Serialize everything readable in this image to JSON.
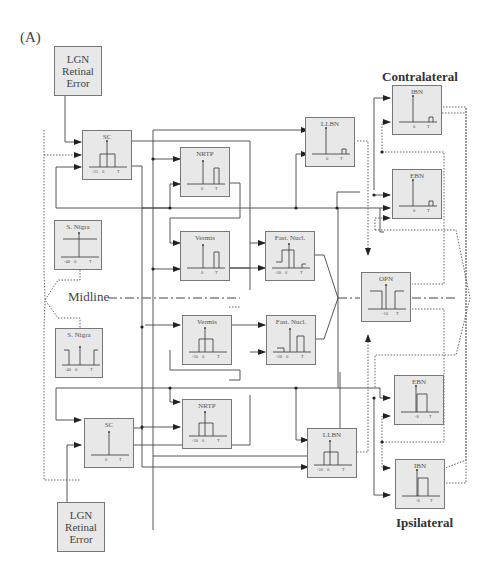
{
  "panel_label": "(A)",
  "side_labels": {
    "contralateral": "Contralateral",
    "ipsilateral": "Ipsilateral"
  },
  "midline_label": "Midline",
  "colors": {
    "box_fill": "#e8e8e8",
    "box_border": "#777777",
    "line": "#333333",
    "dotted": "#555555"
  },
  "boxes": {
    "lgn_top": {
      "title": "LGN\nRetinal\nError"
    },
    "lgn_bot": {
      "title": "LGN\nRetinal\nError"
    },
    "sc_top": {
      "title": "SC",
      "ticks": [
        "-25",
        "0",
        "T"
      ]
    },
    "sc_bot": {
      "title": "SC",
      "ticks": [
        "0",
        "T"
      ]
    },
    "nrtp_top": {
      "title": "NRTP",
      "ticks": [
        "0",
        "T"
      ]
    },
    "nrtp_bot": {
      "title": "NRTP",
      "ticks": [
        "-20",
        "0",
        "T"
      ]
    },
    "vermis_top": {
      "title": "Vermis",
      "ticks": [
        "0",
        "T"
      ]
    },
    "vermis_bot": {
      "title": "Vermis",
      "ticks": [
        "-20",
        "0",
        "T"
      ]
    },
    "snigra_top": {
      "title": "S. Nigra",
      "ticks": [
        "-40",
        "0",
        "T"
      ]
    },
    "snigra_bot": {
      "title": "S. Nigra",
      "ticks": [
        "-40",
        "0",
        "T"
      ]
    },
    "fastn_top": {
      "title": "Fast. Nucl.",
      "ticks": [
        "-20",
        "0",
        "T"
      ]
    },
    "fastn_bot": {
      "title": "Fast. Nucl.",
      "ticks": [
        "-20",
        "0",
        "T"
      ]
    },
    "llbn_top": {
      "title": "LLBN",
      "ticks": [
        "0",
        "T"
      ]
    },
    "llbn_bot": {
      "title": "LLBN",
      "ticks": [
        "-20",
        "0",
        "T"
      ]
    },
    "ibn_top": {
      "title": "IBN",
      "ticks": [
        "0",
        "T"
      ]
    },
    "ebn_top": {
      "title": "EBN",
      "ticks": [
        "0",
        "T"
      ]
    },
    "opn": {
      "title": "OPN",
      "ticks": [
        "-10",
        "T"
      ]
    },
    "ebn_bot": {
      "title": "EBN",
      "ticks": [
        "-8",
        "T"
      ]
    },
    "ibn_bot": {
      "title": "IBN",
      "ticks": [
        "-8",
        "T"
      ]
    }
  }
}
